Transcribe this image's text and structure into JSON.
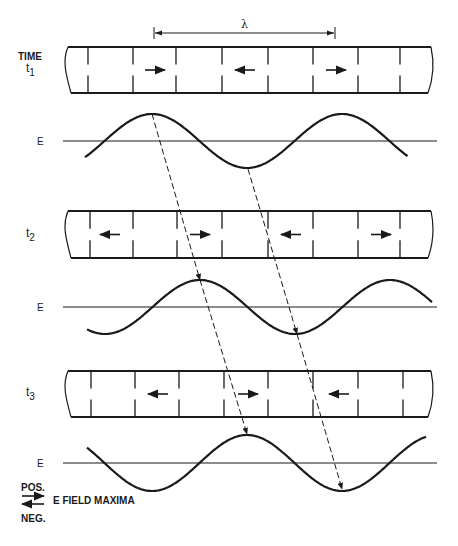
{
  "diagram": {
    "time_label": "TIME",
    "wavelength_label": "λ",
    "wavelength_bracket": {
      "x1": 154,
      "x2": 335,
      "y": 33
    },
    "colors": {
      "ink": "#1a1a1a",
      "background": "#ffffff"
    },
    "panels": [
      {
        "id": "t1",
        "time_label": "t",
        "time_subscript": "1",
        "guide": {
          "top": 47,
          "bottom": 93,
          "left": 70,
          "right": 431,
          "dividers": [
            88,
            133,
            176,
            222,
            268,
            313,
            358,
            400
          ],
          "arrows": [
            {
              "x": 155,
              "dir": "right",
              "polarity": "POS."
            },
            {
              "x": 245,
              "dir": "left",
              "polarity": "NEG."
            },
            {
              "x": 336,
              "dir": "right",
              "polarity": "POS."
            }
          ]
        },
        "field": {
          "axis_label": "E",
          "axis_y": 141,
          "axis_x1": 63,
          "axis_x2": 437,
          "amplitude": 27,
          "period": 190,
          "peak_x": 152,
          "x_start": 85,
          "x_end": 408
        }
      },
      {
        "id": "t2",
        "time_label": "t",
        "time_subscript": "2",
        "guide": {
          "top": 211,
          "bottom": 258,
          "left": 70,
          "right": 431,
          "dividers": [
            90,
            133,
            177,
            222,
            268,
            313,
            358,
            400
          ],
          "arrows": [
            {
              "x": 110,
              "dir": "left",
              "polarity": "NEG."
            },
            {
              "x": 200,
              "dir": "right",
              "polarity": "POS."
            },
            {
              "x": 291,
              "dir": "left",
              "polarity": "NEG."
            },
            {
              "x": 381,
              "dir": "right",
              "polarity": "POS."
            }
          ]
        },
        "field": {
          "axis_label": "E",
          "axis_y": 307,
          "axis_x1": 63,
          "axis_x2": 437,
          "amplitude": 27,
          "period": 190,
          "peak_x": 200,
          "x_start": 87,
          "x_end": 433
        }
      },
      {
        "id": "t3",
        "time_label": "t",
        "time_subscript": "3",
        "guide": {
          "top": 371,
          "bottom": 417,
          "left": 70,
          "right": 431,
          "dividers": [
            91,
            135,
            179,
            224,
            268,
            313,
            358,
            403
          ],
          "arrows": [
            {
              "x": 158,
              "dir": "left",
              "polarity": "NEG."
            },
            {
              "x": 248,
              "dir": "right",
              "polarity": "POS."
            },
            {
              "x": 339,
              "dir": "left",
              "polarity": "NEG."
            }
          ]
        },
        "field": {
          "axis_label": "E",
          "axis_y": 463,
          "axis_x1": 63,
          "axis_x2": 437,
          "amplitude": 28,
          "period": 190,
          "peak_x": 247,
          "x_start": 87,
          "x_end": 427
        }
      }
    ],
    "tracking_lines": [
      {
        "points": [
          [
            152,
            114
          ],
          [
            200,
            280
          ],
          [
            247,
            434
          ]
        ],
        "arrow_at": [
          1,
          2
        ]
      },
      {
        "points": [
          [
            248,
            169
          ],
          [
            297,
            334
          ],
          [
            342,
            489
          ]
        ],
        "arrow_at": [
          1,
          2
        ]
      }
    ],
    "legend": {
      "pos_label": "POS.",
      "neg_label": "NEG.",
      "caption": "E FIELD MAXIMA"
    }
  }
}
